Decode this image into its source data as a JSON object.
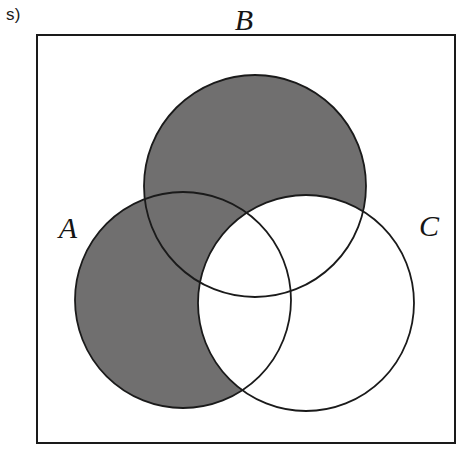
{
  "figure": {
    "part_label": "s)",
    "universe_rect": {
      "x": 37,
      "y": 35,
      "width": 418,
      "height": 408,
      "stroke": "#1a1a1a",
      "stroke_width": 2,
      "fill": "#ffffff"
    },
    "shade_color": "#706F6F",
    "outline_color": "#1a1a1a",
    "shaded_region_expression": "(A union B) minus C",
    "sets": [
      {
        "id": "A",
        "label": "A",
        "cx": 183,
        "cy": 300,
        "r": 108,
        "filled": true,
        "label_x": 68,
        "label_y": 238
      },
      {
        "id": "B",
        "label": "B",
        "cx": 255,
        "cy": 186,
        "r": 111,
        "filled": true,
        "label_x": 244,
        "label_y": 30
      },
      {
        "id": "C",
        "label": "C",
        "cx": 306,
        "cy": 303,
        "r": 108,
        "filled": false,
        "label_x": 429,
        "label_y": 236
      }
    ]
  }
}
